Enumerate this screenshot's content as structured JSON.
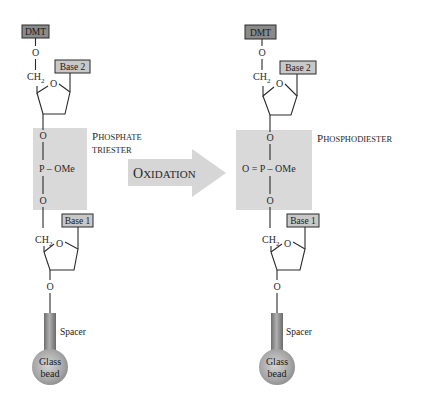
{
  "diagram": {
    "arrow": {
      "label_cap": "O",
      "label_rest": "XIDATION",
      "full_label": "OXIDATION",
      "color": "#d6d6d6"
    },
    "colors": {
      "dmt_box": "#8a8a8a",
      "base_box": "#c8c8c8",
      "phosphate_panel": "#d9d9d9",
      "spacer": "#8c8c8c",
      "bead": "#a8a8a8",
      "line": "#2a2a2a"
    },
    "left": {
      "protecting_group": "DMT",
      "top_oxygen": "O",
      "ch2": "CH",
      "ch2_sub": "2",
      "ring_oxygen": "O",
      "base_top": "Base 2",
      "phosphate": {
        "o_top": "O",
        "p_group": "P – OMe",
        "o_bottom": "O"
      },
      "label_line1_cap": "P",
      "label_line1_rest": "HOSPHATE",
      "label_line2": "TRIESTER",
      "lower_ch2": "CH",
      "lower_ch2_sub": "2",
      "lower_ring_oxygen": "O",
      "base_bottom": "Base 1",
      "bottom_oxygen": "O",
      "spacer_label": "Spacer",
      "bead_line1": "Glass",
      "bead_line2": "bead"
    },
    "right": {
      "protecting_group": "DMT",
      "top_oxygen": "O",
      "ch2": "CH",
      "ch2_sub": "2",
      "ring_oxygen": "O",
      "base_top": "Base 2",
      "phosphate": {
        "o_top": "O",
        "p_group": "O = P – OMe",
        "o_bottom": "O"
      },
      "label_cap": "P",
      "label_rest": "HOSPHODIESTER",
      "lower_ch2": "CH",
      "lower_ch2_sub": "2",
      "lower_ring_oxygen": "O",
      "base_bottom": "Base 1",
      "bottom_oxygen": "O",
      "spacer_label": "Spacer",
      "bead_line1": "Glass",
      "bead_line2": "bead"
    }
  }
}
